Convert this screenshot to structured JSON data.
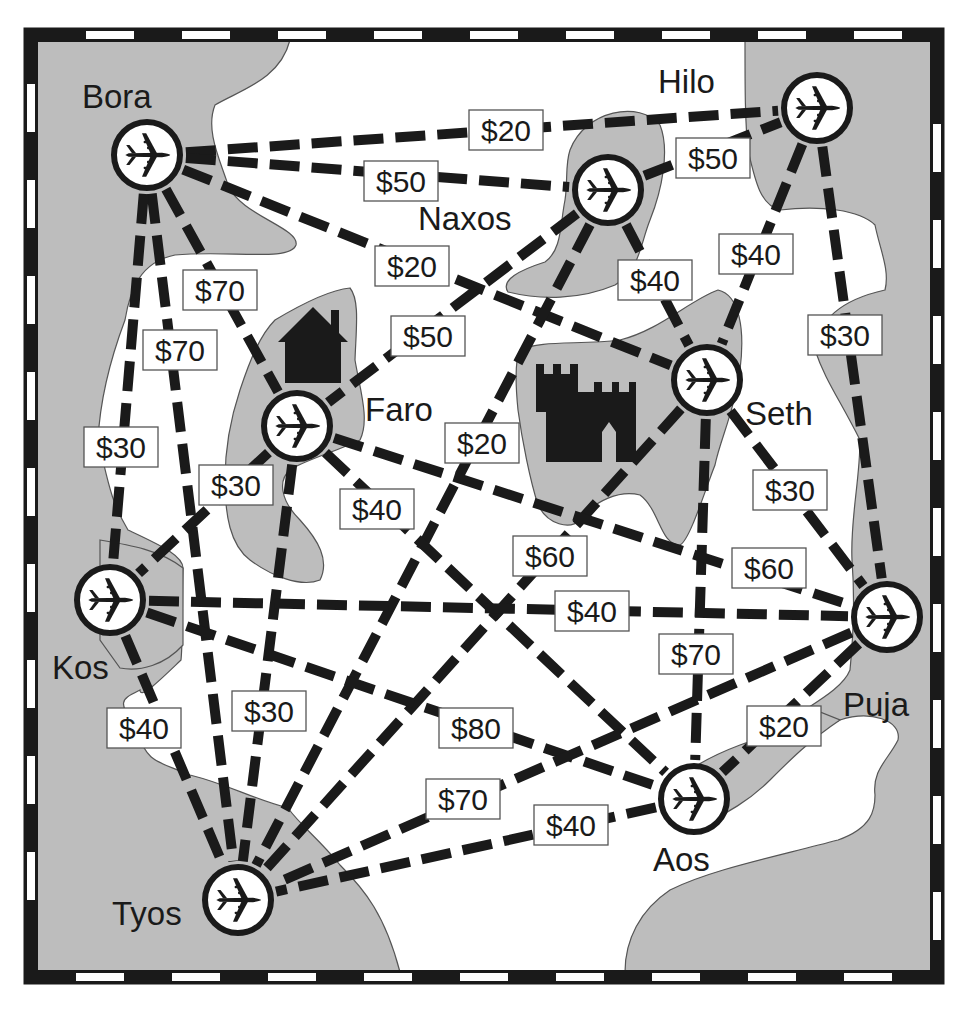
{
  "colors": {
    "land": "#bdbdbd",
    "water": "#ffffff",
    "ink": "#1a1a1a",
    "border_dark": "#1a1a1a",
    "border_light": "#ffffff"
  },
  "map": {
    "type": "flight-route-network",
    "landmarks": [
      {
        "name": "house-icon",
        "x": 313,
        "y": 345
      },
      {
        "name": "castle-icon",
        "x": 584,
        "y": 412
      }
    ]
  },
  "cities": [
    {
      "id": "bora",
      "label": "Bora",
      "x": 147,
      "y": 155,
      "label_x": 82,
      "label_y": 108,
      "icon": "airplane-icon"
    },
    {
      "id": "hilo",
      "label": "Hilo",
      "x": 817,
      "y": 108,
      "label_x": 658,
      "label_y": 93,
      "icon": "airplane-icon"
    },
    {
      "id": "naxos",
      "label": "Naxos",
      "x": 608,
      "y": 190,
      "label_x": 418,
      "label_y": 230,
      "icon": "airplane-icon"
    },
    {
      "id": "faro",
      "label": "Faro",
      "x": 297,
      "y": 426,
      "label_x": 365,
      "label_y": 421,
      "icon": "airplane-icon"
    },
    {
      "id": "seth",
      "label": "Seth",
      "x": 707,
      "y": 380,
      "label_x": 745,
      "label_y": 425,
      "icon": "airplane-icon"
    },
    {
      "id": "kos",
      "label": "Kos",
      "x": 110,
      "y": 600,
      "label_x": 52,
      "label_y": 679,
      "icon": "airplane-icon"
    },
    {
      "id": "puja",
      "label": "Puja",
      "x": 887,
      "y": 617,
      "label_x": 843,
      "label_y": 716,
      "icon": "airplane-icon"
    },
    {
      "id": "aos",
      "label": "Aos",
      "x": 694,
      "y": 799,
      "label_x": 653,
      "label_y": 871,
      "icon": "airplane-icon"
    },
    {
      "id": "tyos",
      "label": "Tyos",
      "x": 238,
      "y": 900,
      "label_x": 112,
      "label_y": 925,
      "icon": "airplane-icon"
    }
  ],
  "routes": [
    {
      "from": "bora",
      "to": "hilo",
      "price": "$20",
      "lx": 506,
      "ly": 130
    },
    {
      "from": "bora",
      "to": "naxos",
      "price": "$50",
      "lx": 401,
      "ly": 181
    },
    {
      "from": "bora",
      "to": "seth",
      "price": "$20",
      "lx": 412,
      "ly": 266
    },
    {
      "from": "bora",
      "to": "faro",
      "price": "$70",
      "lx": 220,
      "ly": 290
    },
    {
      "from": "bora",
      "to": "tyos",
      "price": "$70",
      "lx": 180,
      "ly": 350
    },
    {
      "from": "bora",
      "to": "kos",
      "price": "$30",
      "lx": 121,
      "ly": 447
    },
    {
      "from": "naxos",
      "to": "hilo",
      "price": "$50",
      "lx": 713,
      "ly": 158
    },
    {
      "from": "naxos",
      "to": "seth",
      "price": "$40",
      "lx": 655,
      "ly": 280
    },
    {
      "from": "naxos",
      "to": "faro",
      "price": "$50",
      "lx": 428,
      "ly": 336
    },
    {
      "from": "naxos",
      "to": "tyos",
      "price": "$20",
      "lx": 482,
      "ly": 443
    },
    {
      "from": "hilo",
      "to": "seth",
      "price": "$40",
      "lx": 756,
      "ly": 254
    },
    {
      "from": "hilo",
      "to": "puja",
      "price": "$30",
      "lx": 845,
      "ly": 335
    },
    {
      "from": "seth",
      "to": "puja",
      "price": "$30",
      "lx": 790,
      "ly": 490
    },
    {
      "from": "seth",
      "to": "aos",
      "price": "$70",
      "lx": 696,
      "ly": 654
    },
    {
      "from": "seth",
      "to": "tyos",
      "price": "$60",
      "lx": 550,
      "ly": 556
    },
    {
      "from": "faro",
      "to": "kos",
      "price": "$30",
      "lx": 236,
      "ly": 485
    },
    {
      "from": "faro",
      "to": "tyos",
      "price": "$30",
      "lx": 269,
      "ly": 711
    },
    {
      "from": "faro",
      "to": "aos",
      "price": "$40",
      "lx": 377,
      "ly": 509
    },
    {
      "from": "faro",
      "to": "puja",
      "price": "$60",
      "lx": 769,
      "ly": 568
    },
    {
      "from": "kos",
      "to": "puja",
      "price": "$40",
      "lx": 592,
      "ly": 611
    },
    {
      "from": "kos",
      "to": "aos",
      "price": "$80",
      "lx": 476,
      "ly": 728
    },
    {
      "from": "kos",
      "to": "tyos",
      "price": "$40",
      "lx": 144,
      "ly": 728
    },
    {
      "from": "puja",
      "to": "aos",
      "price": "$20",
      "lx": 784,
      "ly": 726
    },
    {
      "from": "puja",
      "to": "tyos",
      "price": "$70",
      "lx": 463,
      "ly": 799
    },
    {
      "from": "aos",
      "to": "tyos",
      "price": "$40",
      "lx": 571,
      "ly": 825
    }
  ]
}
